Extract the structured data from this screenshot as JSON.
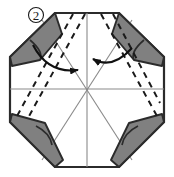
{
  "figure": {
    "kind": "origami-fold-diagram",
    "step_label": "2",
    "step_label_style": "circled-number",
    "caption": "",
    "canvas": {
      "width": 174,
      "height": 177
    },
    "colors": {
      "background": "#ffffff",
      "paper_front": "#ffffff",
      "paper_shaded": "#808080",
      "outline": "#2b2b2b",
      "crease_existing": "#8a8a8a",
      "fold_dashed": "#1a1a1a",
      "arrow": "#111111"
    },
    "shape": {
      "name": "octagon",
      "description": "regular octagon outline forming the folded paper silhouette",
      "vertices": [
        [
          55,
          13
        ],
        [
          119,
          13
        ],
        [
          164,
          57
        ],
        [
          164,
          122
        ],
        [
          119,
          167
        ],
        [
          55,
          167
        ],
        [
          10,
          122
        ],
        [
          10,
          57
        ]
      ]
    },
    "creases": {
      "label": "existing crease lines",
      "lines": [
        {
          "name": "horizontal-crease",
          "from": [
            10,
            89
          ],
          "to": [
            164,
            89
          ]
        },
        {
          "name": "vertical-crease",
          "from": [
            87,
            13
          ],
          "to": [
            87,
            167
          ]
        },
        {
          "name": "diagonal-crease-nw-se",
          "from": [
            42,
            20
          ],
          "to": [
            132,
            160
          ]
        },
        {
          "name": "diagonal-crease-ne-sw",
          "from": [
            132,
            20
          ],
          "to": [
            42,
            160
          ]
        }
      ]
    },
    "fold_lines": {
      "label": "valley fold lines (dashed)",
      "lines": [
        {
          "name": "dashed-fold-left-outer",
          "from": [
            73,
            14
          ],
          "to": [
            17,
            116
          ]
        },
        {
          "name": "dashed-fold-left-inner",
          "from": [
            85,
            14
          ],
          "to": [
            28,
            118
          ]
        },
        {
          "name": "dashed-fold-right-inner",
          "from": [
            101,
            14
          ],
          "to": [
            157,
            116
          ]
        },
        {
          "name": "dashed-fold-right-outer",
          "from": [
            113,
            14
          ],
          "to": [
            160,
            103
          ]
        }
      ]
    },
    "shaded_flaps": [
      {
        "name": "shaded-flap-top-left",
        "position": "top-left",
        "points": [
          [
            10,
            57
          ],
          [
            55,
            13
          ],
          [
            62,
            34
          ],
          [
            40,
            60
          ],
          [
            12,
            66
          ]
        ]
      },
      {
        "name": "shaded-flap-top-right",
        "position": "top-right",
        "points": [
          [
            164,
            57
          ],
          [
            119,
            13
          ],
          [
            112,
            34
          ],
          [
            134,
            60
          ],
          [
            162,
            66
          ]
        ]
      },
      {
        "name": "shaded-flap-bottom-left",
        "position": "bottom-left",
        "points": [
          [
            10,
            122
          ],
          [
            12,
            114
          ],
          [
            45,
            123
          ],
          [
            63,
            160
          ],
          [
            55,
            167
          ]
        ]
      },
      {
        "name": "shaded-flap-bottom-right",
        "position": "bottom-right",
        "points": [
          [
            164,
            122
          ],
          [
            162,
            114
          ],
          [
            129,
            123
          ],
          [
            111,
            160
          ],
          [
            119,
            167
          ]
        ]
      }
    ],
    "arrows": [
      {
        "name": "fold-arrow-left",
        "direction": "points-right",
        "meaning": "fold left flap toward centre",
        "start": [
          33,
          45
        ],
        "end": [
          82,
          71
        ],
        "control": [
          48,
          74
        ]
      },
      {
        "name": "fold-arrow-right",
        "direction": "points-left",
        "meaning": "fold right flap toward centre",
        "start": [
          132,
          48
        ],
        "end": [
          89,
          59
        ],
        "control": [
          112,
          70
        ]
      }
    ]
  }
}
